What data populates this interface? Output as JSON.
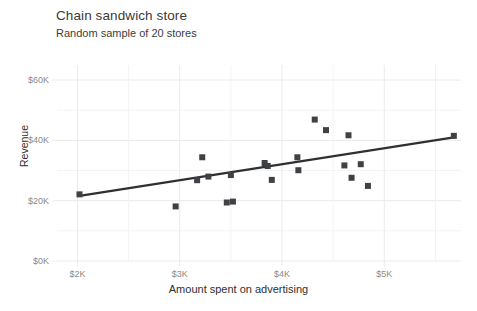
{
  "chart_data": {
    "type": "scatter",
    "title": "Chain sandwich store",
    "subtitle": "Random sample of 20 stores",
    "xlabel": "Amount spent on advertising",
    "ylabel": "Revenue",
    "xlim": [
      1800,
      5750
    ],
    "ylim": [
      0,
      65000
    ],
    "grid": true,
    "legend": null,
    "x_ticks": [
      {
        "value": 2000,
        "label": "$2K"
      },
      {
        "value": 3000,
        "label": "$3K"
      },
      {
        "value": 4000,
        "label": "$4K"
      },
      {
        "value": 5000,
        "label": "$5K"
      }
    ],
    "y_ticks": [
      {
        "value": 0,
        "label": "$0K"
      },
      {
        "value": 20000,
        "label": "$20K"
      },
      {
        "value": 40000,
        "label": "$40K"
      },
      {
        "value": 60000,
        "label": "$60K"
      }
    ],
    "y_minor_ticks": [
      10000,
      30000,
      50000
    ],
    "marker": {
      "shape": "square",
      "size": 6,
      "color": "#3f4144"
    },
    "trendline": {
      "show": true,
      "color": "#2e3033",
      "width": 2.2,
      "x_start": 2020,
      "y_start": 21600,
      "x_end": 5680,
      "y_end": 41000
    },
    "points": [
      {
        "x": 2020,
        "y": 22100
      },
      {
        "x": 2960,
        "y": 18100
      },
      {
        "x": 3170,
        "y": 26800
      },
      {
        "x": 3220,
        "y": 34400
      },
      {
        "x": 3280,
        "y": 28000
      },
      {
        "x": 3460,
        "y": 19400
      },
      {
        "x": 3500,
        "y": 28500
      },
      {
        "x": 3520,
        "y": 19700
      },
      {
        "x": 3830,
        "y": 32500
      },
      {
        "x": 3860,
        "y": 31500
      },
      {
        "x": 3900,
        "y": 26900
      },
      {
        "x": 4150,
        "y": 34400
      },
      {
        "x": 4160,
        "y": 30100
      },
      {
        "x": 4320,
        "y": 46900
      },
      {
        "x": 4430,
        "y": 43400
      },
      {
        "x": 4610,
        "y": 31700
      },
      {
        "x": 4650,
        "y": 41700
      },
      {
        "x": 4680,
        "y": 27600
      },
      {
        "x": 4770,
        "y": 32100
      },
      {
        "x": 4840,
        "y": 24900
      },
      {
        "x": 5680,
        "y": 41500
      }
    ],
    "colors": {
      "background": "#ffffff",
      "grid_major": "#ebebeb",
      "grid_minor": "#f3f3f3",
      "text": "#333333",
      "tick_text": "#8a8a8a",
      "marker": "#3f4144",
      "trendline": "#2e3033"
    }
  }
}
